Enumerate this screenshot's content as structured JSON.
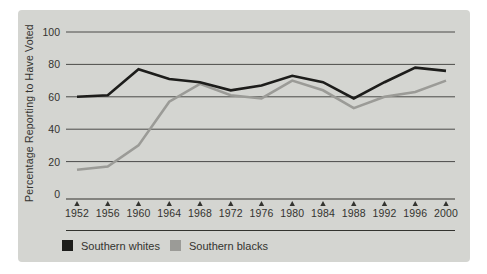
{
  "chart_data": {
    "type": "line",
    "title": "",
    "xlabel": "",
    "ylabel": "Percentage Reporting to Have Voted",
    "ylim": [
      0,
      100
    ],
    "yticks": [
      100,
      80,
      60,
      40,
      20,
      0
    ],
    "grid": true,
    "legend_position": "bottom",
    "categories": [
      "1952",
      "1956",
      "1960",
      "1964",
      "1968",
      "1972",
      "1976",
      "1980",
      "1984",
      "1988",
      "1992",
      "1996",
      "2000"
    ],
    "series": [
      {
        "name": "Southern whites",
        "color": "#1d1d1b",
        "values": [
          60,
          61,
          77,
          71,
          69,
          64,
          67,
          73,
          69,
          59,
          69,
          78,
          76
        ]
      },
      {
        "name": "Southern blacks",
        "color": "#9b9b97",
        "values": [
          15,
          17,
          30,
          57,
          68,
          61,
          59,
          70,
          64,
          53,
          60,
          63,
          70
        ]
      }
    ]
  },
  "colors": {
    "page_bg": "#ffffff",
    "panel_bg": "#d4d5d1",
    "gridline": "#4b4b49",
    "axis": "#33332f",
    "text": "#33332f"
  }
}
